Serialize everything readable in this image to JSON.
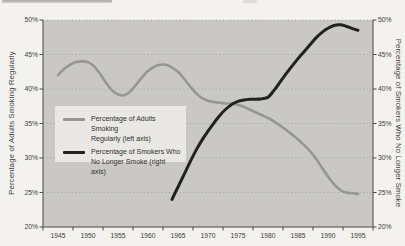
{
  "chart_data": {
    "type": "line",
    "title": "",
    "x": {
      "tick_labels": [
        "1945",
        "1950",
        "1955",
        "1960",
        "1965",
        "1970",
        "1975",
        "1980",
        "1985",
        "1990",
        "1995"
      ],
      "range_years": [
        1945,
        1995
      ]
    },
    "y_left": {
      "axis_label": "Percentage of Adults Smoking Regularly",
      "tick_labels": [
        "50%",
        "45%",
        "40%",
        "35%",
        "30%",
        "25%",
        "20%"
      ],
      "tick_values": [
        50,
        45,
        40,
        35,
        30,
        25,
        20
      ],
      "range": [
        20,
        50
      ]
    },
    "y_right": {
      "axis_label": "Percentage of Smokers Who No Longer Smoke",
      "tick_labels": [
        "50%",
        "45%",
        "40%",
        "35%",
        "30%",
        "25%",
        "20%"
      ],
      "tick_values": [
        50,
        45,
        40,
        35,
        30,
        25,
        20
      ],
      "range": [
        20,
        50
      ]
    },
    "grid": {
      "style": "dotted-horizontal",
      "levels": [
        50,
        45,
        40,
        35,
        30,
        25
      ]
    },
    "legend": {
      "position": "center-left",
      "background": "#eae8e4",
      "entries": [
        {
          "label_line1": "Percentage of Adults Smoking",
          "label_line2": "Regularly (left axis)",
          "color": "#98978f"
        },
        {
          "label_line1": "Percentage of Smokers Who",
          "label_line2": "No Longer Smoke (right axis)",
          "color": "#22211e"
        }
      ]
    },
    "series": [
      {
        "name": "Percentage of Adults Smoking Regularly",
        "axis": "left",
        "color": "#98978f",
        "stroke_width": 2.6,
        "years": [
          1945,
          1946,
          1947,
          1948,
          1949,
          1950,
          1951,
          1952,
          1953,
          1954,
          1955,
          1956,
          1957,
          1958,
          1959,
          1960,
          1961,
          1962,
          1963,
          1964,
          1965,
          1966,
          1967,
          1968,
          1969,
          1970,
          1971,
          1972,
          1973,
          1974,
          1975,
          1976,
          1977,
          1978,
          1979,
          1980,
          1981,
          1982,
          1983,
          1984,
          1985,
          1986,
          1987,
          1988,
          1989,
          1990,
          1991,
          1992,
          1993,
          1994,
          1995
        ],
        "values": [
          42.0,
          42.9,
          43.5,
          43.9,
          44.0,
          43.9,
          43.3,
          42.2,
          40.9,
          39.8,
          39.2,
          39.1,
          39.6,
          40.6,
          41.7,
          42.6,
          43.2,
          43.5,
          43.5,
          43.1,
          42.5,
          41.5,
          40.4,
          39.4,
          38.7,
          38.3,
          38.1,
          38.0,
          37.9,
          37.9,
          37.7,
          37.4,
          37.0,
          36.6,
          36.2,
          35.8,
          35.3,
          34.7,
          34.1,
          33.4,
          32.7,
          31.9,
          31.0,
          29.9,
          28.6,
          27.3,
          26.2,
          25.4,
          25.0,
          24.9,
          24.8
        ]
      },
      {
        "name": "Percentage of Smokers Who No Longer Smoke",
        "axis": "right",
        "color": "#22211e",
        "stroke_width": 3,
        "years": [
          1964,
          1965,
          1966,
          1967,
          1968,
          1969,
          1970,
          1971,
          1972,
          1973,
          1974,
          1975,
          1976,
          1977,
          1978,
          1979,
          1980,
          1981,
          1982,
          1983,
          1984,
          1985,
          1986,
          1987,
          1988,
          1989,
          1990,
          1991,
          1992,
          1993,
          1994,
          1995
        ],
        "values": [
          24.0,
          25.8,
          27.6,
          29.4,
          31.1,
          32.6,
          33.9,
          35.1,
          36.2,
          37.1,
          37.8,
          38.2,
          38.4,
          38.5,
          38.5,
          38.6,
          38.8,
          39.8,
          41.0,
          42.2,
          43.3,
          44.4,
          45.4,
          46.4,
          47.4,
          48.2,
          48.8,
          49.2,
          49.3,
          49.1,
          48.8,
          48.5
        ]
      }
    ],
    "plot_background": "#c9c8c5",
    "grid_color": "#a7a6a3",
    "axis_color": "#4a4947"
  }
}
